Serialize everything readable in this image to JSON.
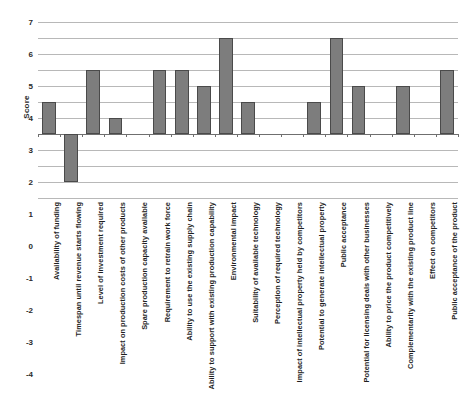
{
  "chart_data": {
    "type": "bar",
    "title": "",
    "subtitle": "",
    "xlabel": "",
    "ylabel": "Score",
    "ylim": [
      -4,
      7
    ],
    "ytick_values": [
      7,
      6,
      5,
      4,
      3,
      2,
      1,
      0,
      -1,
      -2,
      -3,
      -4
    ],
    "ytick_labels": [
      "7",
      "6",
      "5",
      "4",
      "3",
      "2",
      "1",
      "0",
      "-1",
      "-2",
      "-3",
      "-4"
    ],
    "grid": true,
    "legend": "none",
    "orientation": "vertical",
    "bar_color": "#7d7d7d",
    "bar_edge_color": "#4a4a4a",
    "categories": [
      "Availability of funding",
      "Timespan until revenue starts flowing",
      "Level of investment required",
      "Impact on production costs of other products",
      "Spare production capacity available",
      "Requirement to retrain work force",
      "Ability to use the existing supply chain",
      "Ability to support with existing production capability",
      "Environmental impact",
      "Suitability of available technology",
      "Perception of required technology",
      "Impact of intellectual property held by competitors",
      "Potential to generate intellectual property",
      "Public acceptance",
      "Potential for licensing deals with other businesses",
      "Ability to price the product competitively",
      "Complementarity with the existing product line",
      "Effect on competitors",
      "Public acceptance of the product"
    ],
    "values": [
      2,
      -3,
      4,
      1,
      0,
      4,
      4,
      3,
      6,
      2,
      0,
      0,
      2,
      6,
      3,
      0,
      3,
      0,
      4
    ]
  }
}
